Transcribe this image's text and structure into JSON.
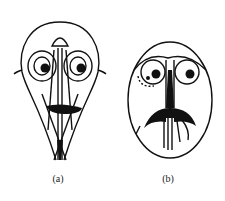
{
  "figure": {
    "panels": [
      {
        "id": "a",
        "label": "(a)",
        "description": "pear-shaped face drawing with two round eyes, dark mouth bar and crossing lines tapering to a point"
      },
      {
        "id": "b",
        "label": "(b)",
        "description": "oval face drawing with two round eyes, brows, long nose and dark drooping moustache"
      }
    ]
  },
  "colors": {
    "ink": "#111111",
    "background": "#ffffff"
  }
}
